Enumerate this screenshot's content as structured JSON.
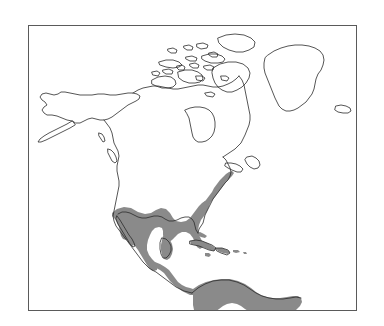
{
  "figure": {
    "type": "range-map",
    "title": "",
    "caption": "",
    "region": "North America",
    "background_color": "#ffffff"
  },
  "frame": {
    "border_color": "#5a5a5a",
    "border_width_px": 1,
    "x": 28,
    "y": 25,
    "width": 329,
    "height": 286
  },
  "map": {
    "projection_hint": "equal-area / conic",
    "coastline_color": "#2b2b2b",
    "coastline_width_px": 0.8,
    "land_fill": "#ffffff",
    "ocean_fill": "#ffffff",
    "landmasses": [
      "Alaska",
      "Canada",
      "Canadian Arctic Archipelago",
      "Greenland",
      "Iceland",
      "Contiguous United States",
      "Mexico",
      "Central America",
      "Caribbean Islands",
      "Northern South America"
    ]
  },
  "range": {
    "legend_label": "",
    "fill_color": "#8a8a8a",
    "outline_color": "#6e6e6e",
    "description": "Shaded distribution range",
    "covered_areas": [
      "Mexico",
      "Baja California",
      "Southern Texas",
      "Gulf Coast",
      "Florida",
      "Atlantic Coastal Plain",
      "Central America",
      "Cuba",
      "Bahamas",
      "Jamaica",
      "Hispaniola",
      "Puerto Rico",
      "Lesser Antilles",
      "Colombia",
      "Venezuela"
    ]
  }
}
